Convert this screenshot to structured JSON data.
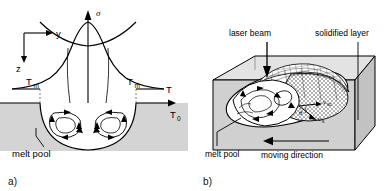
{
  "figure": {
    "panels": [
      {
        "id": "a",
        "caption": "a)",
        "type": "cross-section-schematic",
        "labels": {
          "axis_sigma": "σ",
          "axis_temperature": "T",
          "axis_ambient": "T₀",
          "axis_ambient_base": "T",
          "axis_ambient_sub": "0",
          "melt_temp_left": "T",
          "melt_temp_left_sub": "m",
          "melt_temp_right": "T",
          "melt_temp_right_sub": "m",
          "coord_y": "y",
          "coord_z": "z",
          "melt_pool": "melt pool"
        }
      },
      {
        "id": "b",
        "caption": "b)",
        "type": "3d-block-schematic",
        "labels": {
          "laser_beam": "laser beam",
          "solidified_layer": "solidified layer",
          "melt_pool": "melt pool",
          "moving_direction": "moving direction",
          "velocity_scan_base": "v",
          "velocity_scan_sub": "sc",
          "velocity_solid_base": "v",
          "velocity_solid_sub": "s",
          "angle_theta": "θ"
        }
      }
    ],
    "colors": {
      "background": "#ffffff",
      "substrate_fill": "#d4d4d4",
      "block_top_fill": "#e3e3e3",
      "block_front_fill": "#d0d0d0",
      "block_side_fill": "#c2c2c2",
      "melt_pool_fill": "#ffffff",
      "line": "#000000"
    }
  }
}
